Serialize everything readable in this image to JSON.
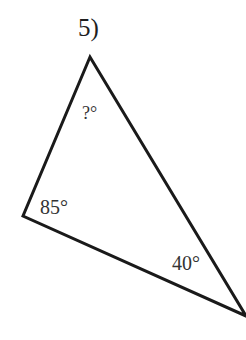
{
  "problem": {
    "number_label": "5)",
    "triangle": {
      "vertices": {
        "top": [
          90,
          57
        ],
        "left": [
          23,
          216
        ],
        "right": [
          246,
          316
        ]
      },
      "stroke_color": "#1a1a1a",
      "angles": {
        "top": "?°",
        "left": "85°",
        "right": "40°"
      }
    }
  }
}
